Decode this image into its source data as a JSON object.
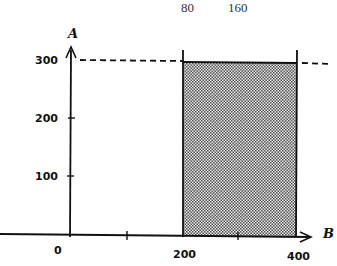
{
  "diagram": {
    "top_labels": [
      {
        "text": "80",
        "x": 190
      },
      {
        "text": "160",
        "x": 242
      }
    ],
    "y_axis": {
      "name": "A",
      "ticks": [
        {
          "value": "300",
          "y": 60
        },
        {
          "value": "200",
          "y": 118
        },
        {
          "value": "100",
          "y": 176
        }
      ]
    },
    "x_axis": {
      "name": "B",
      "ticks": [
        {
          "value": "0",
          "x": 70
        },
        {
          "value": "",
          "x": 127
        },
        {
          "value": "200",
          "x": 183
        },
        {
          "value": "",
          "x": 238
        },
        {
          "value": "400",
          "x": 296
        }
      ]
    },
    "dashed_line": {
      "label": "A = 300"
    },
    "shaded_region": {
      "x_from": "200",
      "x_to": "400",
      "y_from": "0",
      "y_to": "300"
    },
    "colors": {
      "ink": "#111111",
      "shade": "#8a8a8a",
      "background": "#ffffff"
    }
  }
}
